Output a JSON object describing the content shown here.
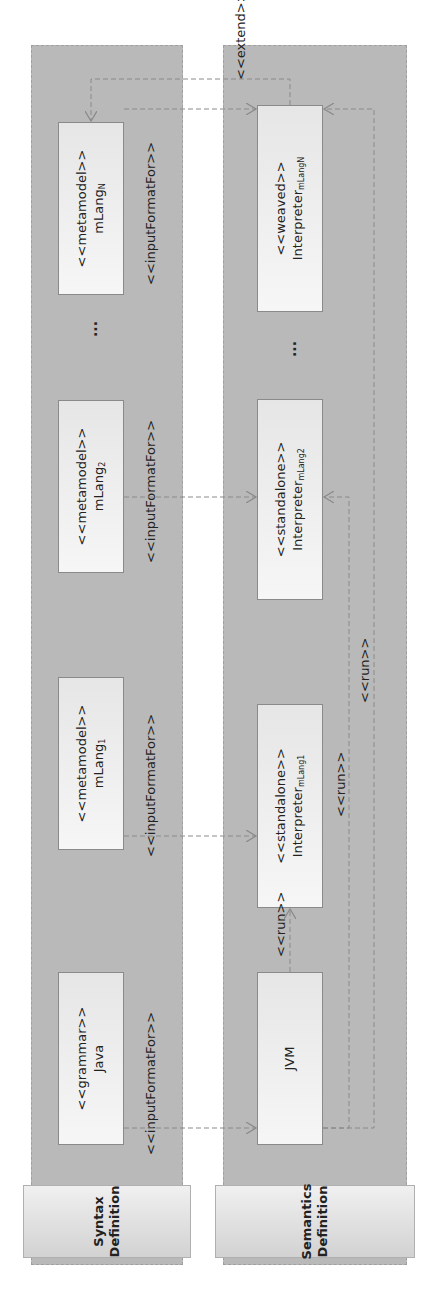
{
  "lanes": {
    "syntax": {
      "title": "Syntax\nDefinition"
    },
    "semantics": {
      "title": "Semantics\nDefinition"
    }
  },
  "syntax_boxes": [
    {
      "stereotype": "<<grammar>>",
      "name": "Java",
      "sub": ""
    },
    {
      "stereotype": "<<metamodel>>",
      "name": "mLang",
      "sub": "1"
    },
    {
      "stereotype": "<<metamodel>>",
      "name": "mLang",
      "sub": "2"
    },
    {
      "stereotype": "<<metamodel>>",
      "name": "mLang",
      "sub": "N"
    }
  ],
  "semantics_boxes": [
    {
      "stereotype": "",
      "name": "JVM",
      "sub": ""
    },
    {
      "stereotype": "<<standalone>>",
      "name": "Interpreter",
      "sub": "mLang1"
    },
    {
      "stereotype": "<<standalone>>",
      "name": "Interpreter",
      "sub": "mLang2"
    },
    {
      "stereotype": "<<weaved>>",
      "name": "Interpreter",
      "sub": "mLangN"
    }
  ],
  "ellipsis": "...",
  "relations": {
    "input_format_for": "<<inputFormatFor>>",
    "run": "<<run>>",
    "extend": "<<extend>>"
  },
  "colors": {
    "lane_fill": "#b9b9b9",
    "box_fill": "#eeeeee",
    "arrow": "#8a8a8a"
  }
}
